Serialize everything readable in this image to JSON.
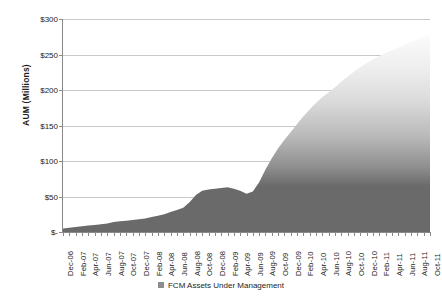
{
  "chart_data": {
    "type": "area",
    "title": "",
    "xlabel": "",
    "ylabel": "AUM (Millions)",
    "ylim": [
      0,
      300
    ],
    "ytick_labels": [
      "$-",
      "$50",
      "$100",
      "$150",
      "$200",
      "$250",
      "$300"
    ],
    "ytick_values": [
      0,
      50,
      100,
      150,
      200,
      250,
      300
    ],
    "grid": true,
    "legend_position": "bottom",
    "legend": [
      "FCM Assets Under Management"
    ],
    "series": [
      {
        "name": "FCM Assets Under Management",
        "values": [
          5,
          6,
          7,
          8,
          9,
          10,
          11,
          12,
          14,
          15,
          16,
          17,
          18,
          19,
          21,
          23,
          25,
          28,
          31,
          34,
          42,
          52,
          58,
          60,
          61,
          62,
          63,
          61,
          58,
          54,
          57,
          70,
          88,
          104,
          118,
          130,
          141,
          152,
          163,
          173,
          182,
          190,
          197,
          204,
          212,
          219,
          226,
          232,
          238,
          243,
          248,
          252,
          256,
          260,
          264,
          268,
          271,
          275,
          278
        ]
      }
    ],
    "x": [
      "Dec-06",
      "Jan-07",
      "Feb-07",
      "Mar-07",
      "Apr-07",
      "May-07",
      "Jun-07",
      "Jul-07",
      "Aug-07",
      "Sep-07",
      "Oct-07",
      "Nov-07",
      "Dec-07",
      "Jan-08",
      "Feb-08",
      "Mar-08",
      "Apr-08",
      "May-08",
      "Jun-08",
      "Jul-08",
      "Aug-08",
      "Sep-08",
      "Oct-08",
      "Nov-08",
      "Dec-08",
      "Jan-09",
      "Feb-09",
      "Mar-09",
      "Apr-09",
      "May-09",
      "Jun-09",
      "Jul-09",
      "Aug-09",
      "Sep-09",
      "Oct-09",
      "Nov-09",
      "Dec-09",
      "Jan-10",
      "Feb-10",
      "Mar-10",
      "Apr-10",
      "May-10",
      "Jun-10",
      "Jul-10",
      "Aug-10",
      "Sep-10",
      "Oct-10",
      "Nov-10",
      "Dec-10",
      "Jan-11",
      "Feb-11",
      "Mar-11",
      "Apr-11",
      "May-11",
      "Jun-11",
      "Jul-11",
      "Aug-11",
      "Sep-11",
      "Oct-11"
    ],
    "xtick_labels": [
      "Dec-06",
      "Feb-07",
      "Apr-07",
      "Jun-07",
      "Aug-07",
      "Oct-07",
      "Dec-07",
      "Feb-08",
      "Apr-08",
      "Jun-08",
      "Aug-08",
      "Oct-08",
      "Dec-08",
      "Feb-09",
      "Apr-09",
      "Jun-09",
      "Aug-09",
      "Oct-09",
      "Dec-09",
      "Feb-10",
      "Apr-10",
      "Jun-10",
      "Aug-10",
      "Oct-10",
      "Dec-10",
      "Feb-11",
      "Apr-11",
      "Jun-11",
      "Aug-11",
      "Oct-11"
    ],
    "colors": {
      "area_dark": "#6a6a6a",
      "area_light": "#f2f2f2",
      "gradient_stop_value": 70,
      "gridline": "#c9c9c9",
      "axis": "#8a8a8a",
      "text": "#1c1c1c",
      "background": "#ffffff",
      "legend_swatch": "#8d8d8d"
    }
  }
}
